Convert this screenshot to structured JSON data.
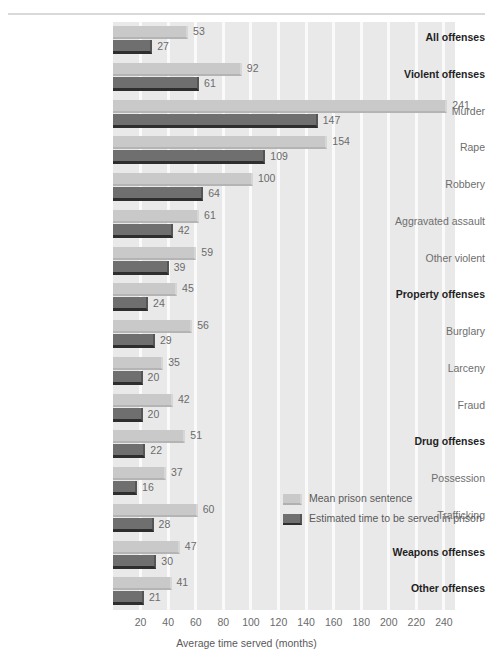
{
  "chart_data": {
    "type": "bar",
    "orientation": "horizontal",
    "title": "",
    "xlabel": "Average time served (months)",
    "ylabel": "",
    "xlim": [
      0,
      248
    ],
    "xticks": [
      20,
      40,
      60,
      80,
      100,
      120,
      140,
      160,
      180,
      200,
      220,
      240
    ],
    "grid": "vertical-white",
    "legend_position": "inside-lower-right",
    "categories": [
      "All offenses",
      "Violent offenses",
      "Murder",
      "Rape",
      "Robbery",
      "Aggravated assault",
      "Other violent",
      "Property offenses",
      "Burglary",
      "Larceny",
      "Fraud",
      "Drug offenses",
      "Possession",
      "Trafficking",
      "Weapons offenses",
      "Other offenses"
    ],
    "emphasis": [
      true,
      true,
      false,
      false,
      false,
      false,
      false,
      true,
      false,
      false,
      false,
      true,
      false,
      false,
      true,
      true
    ],
    "series": [
      {
        "name": "Mean prison sentence",
        "color": "#c9c9c9",
        "values": [
          53,
          92,
          241,
          154,
          100,
          61,
          59,
          45,
          56,
          35,
          42,
          51,
          37,
          60,
          47,
          41
        ]
      },
      {
        "name": "Estimated time to be served in prison",
        "color": "#6f6f6f",
        "values": [
          27,
          61,
          147,
          109,
          64,
          42,
          39,
          24,
          29,
          20,
          20,
          22,
          16,
          28,
          30,
          21
        ]
      }
    ]
  },
  "axis": {
    "x_title": "Average time served (months)",
    "tick_labels": [
      "20",
      "40",
      "60",
      "80",
      "100",
      "120",
      "140",
      "160",
      "180",
      "200",
      "220",
      "240"
    ]
  },
  "legend": {
    "items": [
      {
        "label": "Mean prison sentence",
        "swatch": "light"
      },
      {
        "label": "Estimated time to be served in prison",
        "swatch": "dark"
      }
    ]
  },
  "colors": {
    "plot_background": "#e9e9e9",
    "gridline": "#fafafa",
    "light_bar": "#c9c9c9",
    "dark_bar": "#6f6f6f",
    "dark_bar_shadow": "#2e2e2e",
    "label_text": "#6e6e6e",
    "emphasis_text": "#1f1f1f",
    "page_background": "#ffffff"
  }
}
